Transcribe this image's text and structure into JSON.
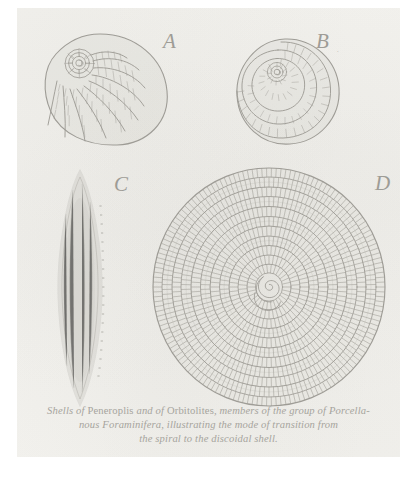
{
  "plate": {
    "background_color": "#f2f1ed",
    "ink_color": "#9e9c96",
    "page_color": "#ffffff"
  },
  "figures": [
    {
      "id": "A",
      "label": "A",
      "name": "peneroplis-spiral-shell",
      "description": "Peneroplis shell, open spiral with radiating chambered ribs"
    },
    {
      "id": "B",
      "label": "B",
      "name": "peneroplis-coiled-shell",
      "description": "Peneroplis shell, tightly coiled rounded spiral",
      "mark": "."
    },
    {
      "id": "C",
      "label": "C",
      "name": "orbitolites-edge-view",
      "description": "Orbitolites shell seen edge on, elongate lens"
    },
    {
      "id": "D",
      "label": "D",
      "name": "orbitolites-discoidal-shell",
      "description": "Orbitolites discoidal shell with concentric chambered rings and spiral nucleus",
      "ring_count": 11
    }
  ],
  "caption": {
    "line1": [
      {
        "text": "Shells of ",
        "style": "italic"
      },
      {
        "text": "Peneroplis",
        "style": "roman"
      },
      {
        "text": " and of ",
        "style": "italic"
      },
      {
        "text": "Orbitolites",
        "style": "roman"
      },
      {
        "text": ", members of the group of Porcella-",
        "style": "italic"
      }
    ],
    "line2": [
      {
        "text": "nous Foraminifera, illustrating the mode of transition from",
        "style": "italic"
      }
    ],
    "line3": [
      {
        "text": "the spiral to the discoidal shell.",
        "style": "italic"
      }
    ],
    "line1_text": "Shells of Peneroplis and of Orbitolites, members of the group of Porcella-",
    "line2_text": "nous Foraminifera, illustrating the mode of transition from",
    "line3_text": "the spiral to the discoidal shell."
  }
}
